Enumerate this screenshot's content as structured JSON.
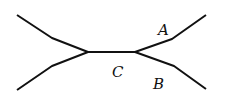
{
  "diagram": {
    "type": "tree",
    "labels": {
      "A": "A",
      "B": "B",
      "C": "C"
    },
    "stroke_color": "#111111",
    "background": "#ffffff"
  }
}
